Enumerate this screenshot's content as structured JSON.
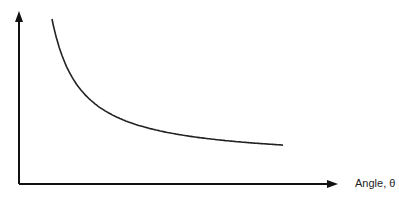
{
  "chart_data": {
    "type": "line",
    "title": "",
    "xlabel": "Angle, θ",
    "ylabel": "",
    "series": [
      {
        "name": "curve",
        "x": [
          0.1,
          0.15,
          0.2,
          0.3,
          0.4,
          0.5,
          0.6,
          0.7,
          0.8,
          0.9
        ],
        "y": [
          1.0,
          0.76,
          0.6,
          0.44,
          0.36,
          0.31,
          0.28,
          0.26,
          0.25,
          0.245
        ]
      }
    ],
    "xlim": [
      0,
      1.15
    ],
    "ylim": [
      0,
      1.1
    ],
    "grid": false,
    "legend": "none"
  }
}
